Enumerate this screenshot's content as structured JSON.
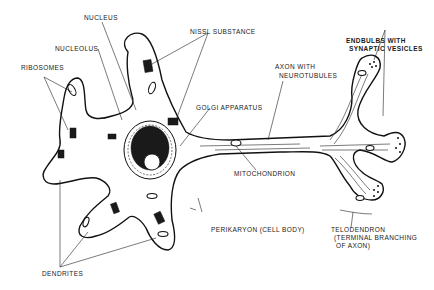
{
  "diagram": {
    "labels": {
      "nucleus": "NUCLEUS",
      "nucleolus": "NUCLEOLUS",
      "ribosomes": "RIBOSOMES",
      "nissl": "NISSL SUBSTANCE",
      "golgi": "GOLGI APPARATUS",
      "axon_line1": "AXON WITH",
      "axon_line2": "NEUROTUBULES",
      "endbulbs_line1": "ENDBULBS WITH",
      "endbulbs_line2": "SYNAPTIC VESICLES",
      "mitochondrion": "MITOCHONDRION",
      "perikaryon": "PERIKARYON (CELL BODY)",
      "telodendron_line1": "TELODENDRON",
      "telodendron_line2": "(TERMINAL BRANCHING",
      "telodendron_line3": "OF AXON)",
      "dendrites": "DENDRITES"
    },
    "colors": {
      "ink": "#111111",
      "background": "#ffffff"
    }
  }
}
